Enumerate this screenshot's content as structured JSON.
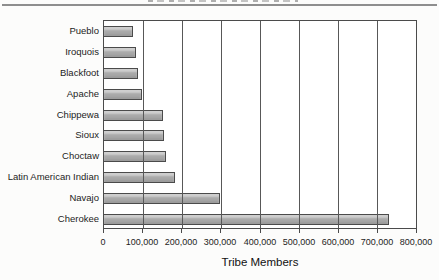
{
  "page": {
    "background_color": "#fcfcfb",
    "top_rule_color": "#8e8e8e",
    "note_top_text": "clipped-illegible"
  },
  "chart_data": {
    "type": "bar",
    "orientation": "horizontal",
    "title": "",
    "xlabel": "Tribe Members",
    "ylabel": "",
    "categories": [
      "Pueblo",
      "Iroquois",
      "Blackfoot",
      "Apache",
      "Chippewa",
      "Sioux",
      "Choctaw",
      "Latin American Indian",
      "Navajo",
      "Cherokee"
    ],
    "values": [
      74000,
      81000,
      86000,
      97000,
      150000,
      153000,
      159000,
      181000,
      298000,
      730000
    ],
    "xlim": [
      0,
      800000
    ],
    "x_ticks": [
      0,
      100000,
      200000,
      300000,
      400000,
      500000,
      600000,
      700000,
      800000
    ],
    "x_tick_labels": [
      "0",
      "100,000",
      "200,000",
      "300,000",
      "400,000",
      "500,000",
      "600,000",
      "700,000",
      "800,000"
    ],
    "grid": true,
    "legend": false,
    "bar_color": "#a8a8a8",
    "bar_border_color": "#4b4b4b",
    "gridline_color": "#585858",
    "plot_border_color": "#4b4b4b",
    "plot_background": "#ffffff",
    "text_color": "#1c1c1c"
  }
}
